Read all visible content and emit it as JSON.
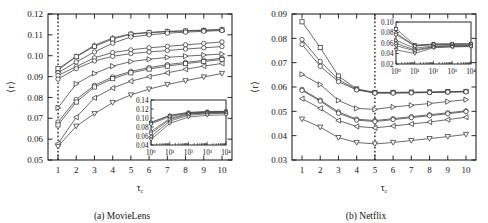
{
  "figure": {
    "panels": [
      {
        "id": "a",
        "caption": "(a) MovieLens",
        "ylabel": "⟨r⟩",
        "xlabel": "τ",
        "xlabel_sub": "c"
      },
      {
        "id": "b",
        "caption": "(b) Netflix",
        "ylabel": "⟨r⟩",
        "xlabel": "τ",
        "xlabel_sub": "c"
      }
    ]
  },
  "chart_data": [
    {
      "type": "line",
      "panel": "a",
      "title": "(a) MovieLens",
      "xlabel": "τc",
      "ylabel": "⟨r⟩",
      "xlim": [
        0.45,
        10.55
      ],
      "ylim": [
        0.05,
        0.12
      ],
      "yticks": [
        0.05,
        0.06,
        0.07,
        0.08,
        0.09,
        0.1,
        0.11,
        0.12
      ],
      "ytick_labels": [
        "0.05",
        "0.06",
        "0.07",
        "0.08",
        "0.09",
        "0.10",
        "0.11",
        "0.12"
      ],
      "xticks": [
        1,
        2,
        3,
        4,
        5,
        6,
        7,
        8,
        9,
        10
      ],
      "xtick_labels": [
        "1",
        "2",
        "3",
        "4",
        "5",
        "6",
        "7",
        "8",
        "9",
        "10"
      ],
      "grid": false,
      "legend": "none",
      "vline": {
        "x": 1,
        "style": "dotted"
      },
      "x": [
        1,
        2,
        3,
        4,
        5,
        6,
        7,
        8,
        9,
        10
      ],
      "series": [
        {
          "name": "s1",
          "marker": "triangle-up",
          "values": [
            0.093,
            0.0997,
            0.105,
            0.1085,
            0.1105,
            0.1112,
            0.1117,
            0.112,
            0.1123,
            0.1126
          ]
        },
        {
          "name": "s2",
          "marker": "square",
          "values": [
            0.0938,
            0.0995,
            0.1045,
            0.108,
            0.1103,
            0.111,
            0.1115,
            0.1118,
            0.1121,
            0.1124
          ]
        },
        {
          "name": "s3",
          "marker": "circle",
          "values": [
            0.0918,
            0.097,
            0.1018,
            0.106,
            0.109,
            0.11,
            0.1108,
            0.1113,
            0.1117,
            0.1121
          ]
        },
        {
          "name": "s4",
          "marker": "circle",
          "values": [
            0.0905,
            0.0948,
            0.099,
            0.1015,
            0.1028,
            0.1038,
            0.1045,
            0.1052,
            0.1059,
            0.1066
          ]
        },
        {
          "name": "s5",
          "marker": "circle",
          "values": [
            0.0888,
            0.0938,
            0.0975,
            0.0997,
            0.101,
            0.1018,
            0.1025,
            0.1032,
            0.1038,
            0.1044
          ]
        },
        {
          "name": "s6",
          "marker": "triangle-right",
          "values": [
            0.075,
            0.0865,
            0.0915,
            0.095,
            0.0972,
            0.0983,
            0.0992,
            0.0998,
            0.1003,
            0.1008
          ]
        },
        {
          "name": "s7",
          "marker": "circle",
          "values": [
            0.0682,
            0.079,
            0.0858,
            0.0898,
            0.0925,
            0.0943,
            0.0957,
            0.0968,
            0.0978,
            0.0988
          ]
        },
        {
          "name": "s8",
          "marker": "square",
          "values": [
            0.0668,
            0.0778,
            0.085,
            0.089,
            0.0918,
            0.0936,
            0.095,
            0.0962,
            0.0972,
            0.0982
          ]
        },
        {
          "name": "s9",
          "marker": "triangle-left",
          "values": [
            0.0578,
            0.0705,
            0.0798,
            0.0845,
            0.0878,
            0.09,
            0.0918,
            0.0935,
            0.095,
            0.0963
          ]
        },
        {
          "name": "s10",
          "marker": "triangle-down",
          "values": [
            0.0565,
            0.0662,
            0.0722,
            0.0775,
            0.0812,
            0.084,
            0.0862,
            0.088,
            0.0898,
            0.0915
          ]
        }
      ],
      "inset": {
        "type": "line",
        "xscale": "log",
        "xlim": [
          1,
          10000
        ],
        "ylim": [
          0.04,
          0.14
        ],
        "yticks": [
          0.04,
          0.06,
          0.08,
          0.1,
          0.12,
          0.14
        ],
        "ytick_labels": [
          "0.04",
          "0.06",
          "0.08",
          "0.10",
          "0.12",
          "0.14"
        ],
        "xticks": [
          1,
          10,
          100,
          1000,
          10000
        ],
        "xtick_labels": [
          "10⁰",
          "10¹",
          "10²",
          "10³",
          "10⁴"
        ],
        "x": [
          1,
          10,
          100,
          1000,
          10000
        ],
        "series": [
          {
            "name": "i1",
            "marker": "triangle-up",
            "values": [
              0.0905,
              0.106,
              0.1125,
              0.1145,
              0.115
            ]
          },
          {
            "name": "i2",
            "marker": "square",
            "values": [
              0.0895,
              0.105,
              0.1118,
              0.1138,
              0.1145
            ]
          },
          {
            "name": "i3",
            "marker": "circle",
            "values": [
              0.087,
              0.103,
              0.111,
              0.113,
              0.1138
            ]
          },
          {
            "name": "i4",
            "marker": "circle",
            "values": [
              0.07,
              0.099,
              0.1095,
              0.112,
              0.1128
            ]
          },
          {
            "name": "i5",
            "marker": "circle",
            "values": [
              0.066,
              0.0965,
              0.1085,
              0.1112,
              0.112
            ]
          },
          {
            "name": "i6",
            "marker": "triangle-left",
            "values": [
              0.059,
              0.093,
              0.106,
              0.1095,
              0.1105
            ]
          },
          {
            "name": "i7",
            "marker": "triangle-down",
            "values": [
              0.052,
              0.088,
              0.102,
              0.106,
              0.107
            ]
          }
        ]
      }
    },
    {
      "type": "line",
      "panel": "b",
      "title": "(b) Netflix",
      "xlabel": "τc",
      "ylabel": "⟨r⟩",
      "xlim": [
        0.45,
        10.55
      ],
      "ylim": [
        0.03,
        0.09
      ],
      "yticks": [
        0.03,
        0.04,
        0.05,
        0.06,
        0.07,
        0.08,
        0.09
      ],
      "ytick_labels": [
        "0.03",
        "0.04",
        "0.05",
        "0.06",
        "0.07",
        "0.08",
        "0.09"
      ],
      "xticks": [
        1,
        2,
        3,
        4,
        5,
        6,
        7,
        8,
        9,
        10
      ],
      "xtick_labels": [
        "1",
        "2",
        "3",
        "4",
        "5",
        "6",
        "7",
        "8",
        "9",
        "10"
      ],
      "grid": false,
      "legend": "none",
      "vline": {
        "x": 5,
        "style": "dotted"
      },
      "x": [
        1,
        2,
        3,
        4,
        5,
        6,
        7,
        8,
        9,
        10
      ],
      "series": [
        {
          "name": "t1",
          "marker": "square",
          "values": [
            0.0868,
            0.0762,
            0.0645,
            0.0592,
            0.0578,
            0.0578,
            0.0579,
            0.058,
            0.0581,
            0.0582
          ]
        },
        {
          "name": "t2",
          "marker": "circle",
          "values": [
            0.0795,
            0.0705,
            0.063,
            0.059,
            0.0576,
            0.0576,
            0.0577,
            0.0578,
            0.058,
            0.0581
          ]
        },
        {
          "name": "t3",
          "marker": "circle",
          "values": [
            0.0775,
            0.0685,
            0.0622,
            0.0588,
            0.0575,
            0.0575,
            0.0576,
            0.0577,
            0.0579,
            0.058
          ]
        },
        {
          "name": "t4",
          "marker": "triangle-right",
          "values": [
            0.0652,
            0.061,
            0.0545,
            0.0512,
            0.0508,
            0.0518,
            0.0525,
            0.0532,
            0.054,
            0.0548
          ]
        },
        {
          "name": "t5",
          "marker": "circle",
          "values": [
            0.059,
            0.0546,
            0.0498,
            0.0468,
            0.0462,
            0.047,
            0.0478,
            0.0486,
            0.0494,
            0.0502
          ]
        },
        {
          "name": "t6",
          "marker": "circle",
          "values": [
            0.0586,
            0.0542,
            0.0492,
            0.0464,
            0.0458,
            0.0466,
            0.0474,
            0.0482,
            0.049,
            0.0499
          ]
        },
        {
          "name": "t7",
          "marker": "triangle-left",
          "values": [
            0.0552,
            0.0512,
            0.0462,
            0.0438,
            0.0432,
            0.044,
            0.0448,
            0.0456,
            0.0466,
            0.0476
          ]
        },
        {
          "name": "t8",
          "marker": "triangle-down",
          "values": [
            0.0468,
            0.0435,
            0.0392,
            0.0372,
            0.0366,
            0.0372,
            0.038,
            0.0388,
            0.0396,
            0.0405
          ]
        }
      ],
      "inset": {
        "type": "line",
        "xscale": "log",
        "xlim": [
          1,
          10000
        ],
        "ylim": [
          0.02,
          0.1
        ],
        "yticks": [
          0.02,
          0.04,
          0.06,
          0.08,
          0.1
        ],
        "ytick_labels": [
          "0.02",
          "0.04",
          "0.06",
          "0.08",
          "0.10"
        ],
        "xticks": [
          1,
          10,
          100,
          1000,
          10000
        ],
        "xtick_labels": [
          "10⁰",
          "10¹",
          "10²",
          "10³",
          "10⁴"
        ],
        "x": [
          1,
          10,
          100,
          1000,
          10000
        ],
        "series": [
          {
            "name": "j1",
            "marker": "square",
            "values": [
              0.087,
              0.056,
              0.058,
              0.0582,
              0.0583
            ]
          },
          {
            "name": "j2",
            "marker": "circle",
            "values": [
              0.079,
              0.0548,
              0.0576,
              0.058,
              0.0581
            ]
          },
          {
            "name": "j3",
            "marker": "circle",
            "values": [
              0.076,
              0.054,
              0.0572,
              0.0578,
              0.0579
            ]
          },
          {
            "name": "j4",
            "marker": "triangle-right",
            "values": [
              0.065,
              0.05,
              0.0545,
              0.0552,
              0.0556
            ]
          },
          {
            "name": "j5",
            "marker": "circle",
            "values": [
              0.059,
              0.047,
              0.053,
              0.0542,
              0.0548
            ]
          },
          {
            "name": "j6",
            "marker": "triangle-left",
            "values": [
              0.055,
              0.045,
              0.052,
              0.0534,
              0.054
            ]
          },
          {
            "name": "j7",
            "marker": "triangle-down",
            "values": [
              0.047,
              0.04,
              0.051,
              0.0525,
              0.0532
            ]
          }
        ]
      }
    }
  ]
}
